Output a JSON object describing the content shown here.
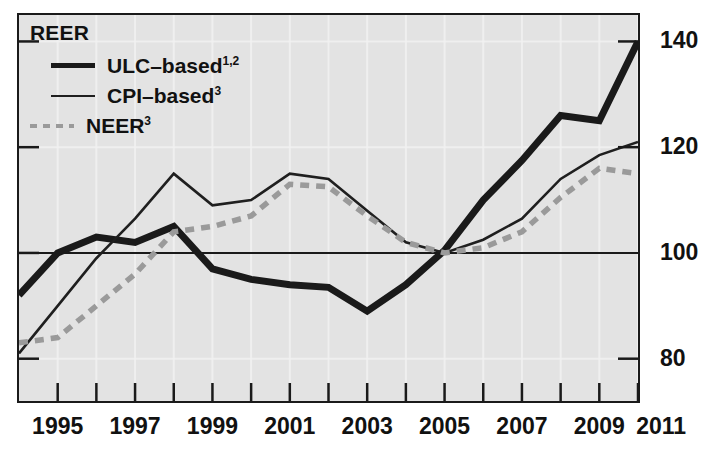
{
  "chart_data": {
    "type": "line",
    "title": "REER",
    "xlabel": "",
    "ylabel": "",
    "xlim": [
      1994,
      2010
    ],
    "ylim": [
      72,
      145
    ],
    "yticks": [
      80,
      100,
      120,
      140
    ],
    "ytick_labels": [
      "80",
      "100",
      "120",
      "140"
    ],
    "xticks": [
      1994,
      1995,
      1996,
      1997,
      1998,
      1999,
      2000,
      2001,
      2002,
      2003,
      2004,
      2005,
      2006,
      2007,
      2008,
      2009,
      2010
    ],
    "xtick_labels": [
      "1995",
      "1997",
      "1999",
      "2001",
      "2003",
      "2005",
      "2007",
      "2009",
      "2011"
    ],
    "xtick_label_years": [
      1995,
      1997,
      1999,
      2001,
      2003,
      2005,
      2007,
      2009,
      2010.6
    ],
    "grid": true,
    "gridline_color": "#f2f2f2",
    "plot_background": "#e3e3e3",
    "reference_line": 100,
    "legend_position": "top-left",
    "x": [
      1994,
      1995,
      1996,
      1997,
      1998,
      1999,
      2000,
      2001,
      2002,
      2003,
      2004,
      2005,
      2006,
      2007,
      2008,
      2009,
      2010
    ],
    "series": [
      {
        "name": "ULC–based",
        "footnotes": "1,2",
        "style": "thick-solid",
        "color": "#1a1a1a",
        "values": [
          92.0,
          100.0,
          103.0,
          102.0,
          105.0,
          97.0,
          95.0,
          94.0,
          93.5,
          89.0,
          94.0,
          100.5,
          110.0,
          117.5,
          126.0,
          125.0,
          140.0
        ]
      },
      {
        "name": "CPI–based",
        "footnotes": "3",
        "style": "thin-solid",
        "color": "#1f1f1f",
        "values": [
          81.0,
          90.0,
          99.0,
          106.5,
          115.0,
          109.0,
          110.0,
          115.0,
          114.0,
          108.0,
          102.0,
          100.0,
          102.5,
          106.5,
          114.0,
          118.5,
          121.0
        ]
      },
      {
        "name": "NEER",
        "footnotes": "3",
        "style": "gray-dashed",
        "color": "#9a9a9a",
        "values": [
          83.0,
          84.0,
          90.0,
          96.0,
          104.0,
          105.0,
          107.0,
          113.0,
          112.5,
          107.0,
          102.0,
          100.0,
          101.0,
          104.0,
          110.5,
          116.0,
          115.0
        ]
      }
    ]
  },
  "legend": {
    "title": "REER",
    "entries": [
      {
        "label": "ULC–based",
        "sup": "1,2",
        "swatch": "thick-line-swatch"
      },
      {
        "label": "CPI–based",
        "sup": "3",
        "swatch": "thin-line-swatch"
      },
      {
        "label": "NEER",
        "sup": "3",
        "swatch": "dashed-line-swatch"
      }
    ]
  }
}
